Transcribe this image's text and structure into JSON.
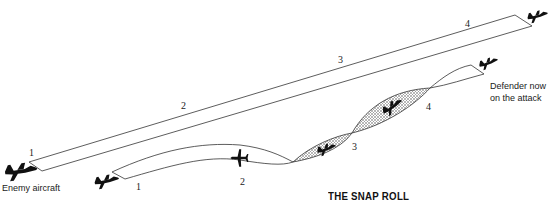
{
  "diagram": {
    "title": "THE SNAP ROLL",
    "labels": {
      "enemy": "Enemy aircraft",
      "defender_line1": "Defender now",
      "defender_line2": "on the attack"
    },
    "enemy_path": {
      "name": "Enemy aircraft path (upper ribbon)",
      "positions": [
        "1",
        "2",
        "3",
        "4"
      ]
    },
    "defender_path": {
      "name": "Defender path (lower ribbon, snap roll)",
      "positions": [
        "1",
        "2",
        "3",
        "4"
      ]
    },
    "colors": {
      "line": "#333333",
      "aircraft": "#111111",
      "hatch": "#9a9a9a",
      "background": "#ffffff"
    }
  }
}
